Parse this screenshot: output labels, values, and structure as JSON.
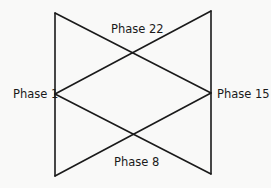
{
  "diagram": {
    "nodes": [
      {
        "id": "p1",
        "label": "Phase 1"
      },
      {
        "id": "p15",
        "label": "Phase 15"
      },
      {
        "id": "p22",
        "label": "Phase 22"
      },
      {
        "id": "p8",
        "label": "Phase 8"
      }
    ],
    "edges": [
      {
        "name": "left-vertical"
      },
      {
        "name": "right-vertical"
      },
      {
        "name": "top-left-to-right-middle"
      },
      {
        "name": "left-middle-to-top-right"
      },
      {
        "name": "left-middle-to-bottom-right"
      },
      {
        "name": "bottom-left-to-right-middle"
      }
    ],
    "colors": {
      "line": "#1a1a1a",
      "background": "#f9f9f8"
    }
  }
}
